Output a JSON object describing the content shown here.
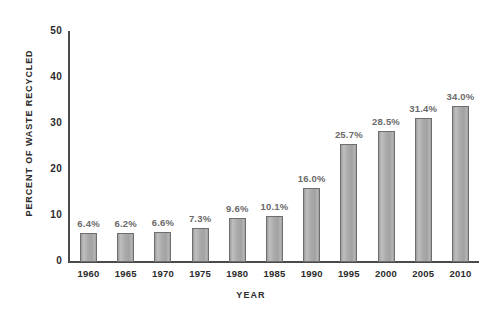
{
  "chart_data": {
    "type": "bar",
    "title": "",
    "xlabel": "YEAR",
    "ylabel": "PERCENT OF WASTE RECYCLED",
    "categories": [
      "1960",
      "1965",
      "1970",
      "1975",
      "1980",
      "1985",
      "1990",
      "1995",
      "2000",
      "2005",
      "2010"
    ],
    "values": [
      6.4,
      6.2,
      6.6,
      7.3,
      9.6,
      10.1,
      16.0,
      25.7,
      28.5,
      31.4,
      34.0
    ],
    "data_labels": [
      "6.4%",
      "6.2%",
      "6.6%",
      "7.3%",
      "9.6%",
      "10.1%",
      "16.0%",
      "25.7%",
      "28.5%",
      "31.4%",
      "34.0%"
    ],
    "ylim": [
      0,
      50
    ],
    "yticks": [
      0,
      10,
      20,
      30,
      40,
      50
    ],
    "ytick_labels": [
      "0",
      "10",
      "20",
      "30",
      "40",
      "50"
    ],
    "grid": false,
    "legend": null,
    "colors": {
      "bar_fill": "#ababab",
      "bar_border": "#6e6e6e",
      "axis": "#4a4a4a",
      "label_text": "#2b2b2b",
      "value_text": "#6a6a6a",
      "background": "#ffffff"
    }
  }
}
